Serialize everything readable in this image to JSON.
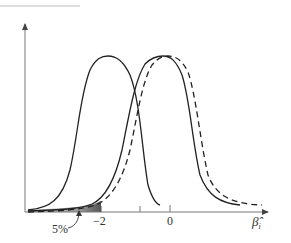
{
  "diagram": {
    "type": "sampling distributions",
    "curves": [
      {
        "name": "left-distribution",
        "style": "solid",
        "peak_x_label": "around -1"
      },
      {
        "name": "centered-distribution",
        "style": "solid",
        "peak_x_label": "0"
      },
      {
        "name": "shifted-distribution",
        "style": "dashed",
        "peak_x_label": "slightly right of 0"
      }
    ],
    "shaded_region": {
      "label": "5%",
      "from": "left tail",
      "to": "-2"
    },
    "x_axis": {
      "label": "β̂ᵢ",
      "ticks": [
        {
          "value": "−2",
          "label": "−2"
        },
        {
          "value": "-1",
          "label": ""
        },
        {
          "value": "0",
          "label": "0"
        }
      ]
    },
    "labels": {
      "percent": "5%",
      "tick_minus2": "−2",
      "tick_zero": "0",
      "axis_symbol": "β̂",
      "axis_subscript": "i"
    },
    "colors": {
      "line": "#222222",
      "axis": "#666666",
      "shade_dark": "#555555",
      "shade_light": "#bbbbbb"
    }
  }
}
